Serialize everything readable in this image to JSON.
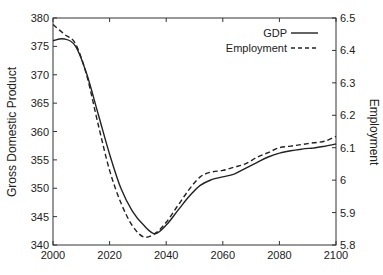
{
  "chart_data": {
    "type": "line",
    "title": "",
    "xlabel": "",
    "ylabel": "Gross Domestic Product",
    "y2label": "Employment",
    "xlim": [
      2000,
      2100
    ],
    "ylim": [
      340,
      380
    ],
    "y2lim": [
      5.8,
      6.5
    ],
    "xticks": [
      2000,
      2020,
      2040,
      2060,
      2080,
      2100
    ],
    "yticks": [
      340,
      345,
      350,
      355,
      360,
      365,
      370,
      375,
      380
    ],
    "y2ticks": [
      "5.8",
      "5.9",
      "6",
      "6.1",
      "6.2",
      "6.3",
      "6.4",
      "6.5"
    ],
    "grid": false,
    "legend_position": "upper right",
    "x": [
      2000,
      2004,
      2008,
      2012,
      2016,
      2020,
      2024,
      2028,
      2032,
      2036,
      2040,
      2044,
      2048,
      2052,
      2056,
      2060,
      2064,
      2068,
      2072,
      2076,
      2080,
      2084,
      2088,
      2092,
      2096,
      2100
    ],
    "series": [
      {
        "name": "GDP",
        "axis": "left",
        "style": "solid",
        "color": "#222222",
        "values": [
          376,
          376.3,
          375,
          370,
          363,
          356,
          350,
          346,
          343.5,
          342,
          343.5,
          346,
          348.5,
          350.5,
          351.5,
          352,
          352.5,
          353.5,
          354.5,
          355.5,
          356.2,
          356.6,
          356.9,
          357.1,
          357.4,
          357.8
        ]
      },
      {
        "name": "Employment",
        "axis": "right",
        "style": "dashed",
        "color": "#222222",
        "values": [
          6.48,
          6.45,
          6.42,
          6.32,
          6.17,
          6.03,
          5.93,
          5.86,
          5.825,
          5.835,
          5.87,
          5.92,
          5.97,
          6.01,
          6.025,
          6.03,
          6.04,
          6.05,
          6.07,
          6.085,
          6.1,
          6.105,
          6.11,
          6.115,
          6.12,
          6.135
        ]
      }
    ]
  },
  "legend": {
    "items": [
      {
        "label": "GDP",
        "style": "solid"
      },
      {
        "label": "Employment",
        "style": "dashed"
      }
    ]
  }
}
